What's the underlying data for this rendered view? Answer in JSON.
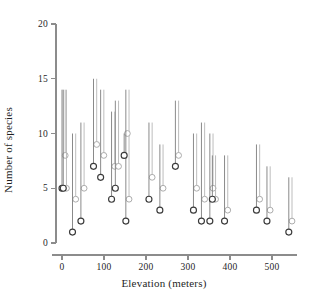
{
  "chart_data": {
    "type": "scatter",
    "title": "",
    "xlabel": "Elevation (meters)",
    "ylabel": "Number of species",
    "xlim": [
      -25,
      560
    ],
    "ylim": [
      0,
      20
    ],
    "xticks": [
      0,
      100,
      200,
      300,
      400,
      500
    ],
    "xticklabels": [
      "0",
      "100",
      "200",
      "300",
      "400",
      "500"
    ],
    "yticks": [
      0,
      5,
      10,
      15,
      20
    ],
    "yticklabels": [
      "0",
      "5",
      "10",
      "15",
      "20"
    ],
    "grid": false,
    "legend": null,
    "marker": "open-circle",
    "error_style": "upper-range-line",
    "series": [
      {
        "name": "observed",
        "color": "#3a3a3a",
        "points": [
          {
            "x": 0,
            "y": 5,
            "upper": 14
          },
          {
            "x": 3,
            "y": 5,
            "upper": 14
          },
          {
            "x": 25,
            "y": 1,
            "upper": 10
          },
          {
            "x": 45,
            "y": 2,
            "upper": 11
          },
          {
            "x": 75,
            "y": 7,
            "upper": 15
          },
          {
            "x": 92,
            "y": 6,
            "upper": 14
          },
          {
            "x": 118,
            "y": 4,
            "upper": 12
          },
          {
            "x": 127,
            "y": 5,
            "upper": 13
          },
          {
            "x": 152,
            "y": 2,
            "upper": 14
          },
          {
            "x": 148,
            "y": 8,
            "upper": 10
          },
          {
            "x": 207,
            "y": 4,
            "upper": 11
          },
          {
            "x": 233,
            "y": 3,
            "upper": 9
          },
          {
            "x": 270,
            "y": 7,
            "upper": 13
          },
          {
            "x": 313,
            "y": 3,
            "upper": 10
          },
          {
            "x": 332,
            "y": 2,
            "upper": 11
          },
          {
            "x": 352,
            "y": 2,
            "upper": 10
          },
          {
            "x": 358,
            "y": 4,
            "upper": 8
          },
          {
            "x": 387,
            "y": 2,
            "upper": 8
          },
          {
            "x": 463,
            "y": 3,
            "upper": 9
          },
          {
            "x": 488,
            "y": 2,
            "upper": 7
          },
          {
            "x": 540,
            "y": 1,
            "upper": 6
          }
        ]
      },
      {
        "name": "estimated",
        "color": "#9a9a9a",
        "points": [
          {
            "x": 0,
            "y": 8,
            "upper": 14
          },
          {
            "x": 3,
            "y": 5,
            "upper": 14
          },
          {
            "x": 25,
            "y": 4,
            "upper": 10
          },
          {
            "x": 45,
            "y": 5,
            "upper": 11
          },
          {
            "x": 75,
            "y": 9,
            "upper": 15
          },
          {
            "x": 92,
            "y": 8,
            "upper": 14
          },
          {
            "x": 118,
            "y": 7,
            "upper": 12
          },
          {
            "x": 127,
            "y": 7,
            "upper": 13
          },
          {
            "x": 152,
            "y": 4,
            "upper": 14
          },
          {
            "x": 148,
            "y": 10,
            "upper": 10
          },
          {
            "x": 207,
            "y": 6,
            "upper": 11
          },
          {
            "x": 233,
            "y": 5,
            "upper": 9
          },
          {
            "x": 270,
            "y": 8,
            "upper": 13
          },
          {
            "x": 313,
            "y": 5,
            "upper": 10
          },
          {
            "x": 332,
            "y": 4,
            "upper": 11
          },
          {
            "x": 352,
            "y": 5,
            "upper": 10
          },
          {
            "x": 358,
            "y": 4,
            "upper": 8
          },
          {
            "x": 387,
            "y": 3,
            "upper": 8
          },
          {
            "x": 463,
            "y": 4,
            "upper": 9
          },
          {
            "x": 488,
            "y": 3,
            "upper": 7
          },
          {
            "x": 540,
            "y": 2,
            "upper": 6
          }
        ]
      }
    ]
  },
  "style": {
    "axis_color": "#8c8c8c",
    "line_color_dark": "#7d7d7d",
    "line_color_light": "#b5b5b5",
    "marker_dark": "#3a3a3a",
    "marker_light": "#a8a8a8",
    "background": "#ffffff"
  },
  "geometry": {
    "x0_px": 62,
    "x_per_unit_px": 0.42,
    "y0_px": 243,
    "y_per_unit_px": 10.95,
    "dx_pair_px": 3.2
  }
}
